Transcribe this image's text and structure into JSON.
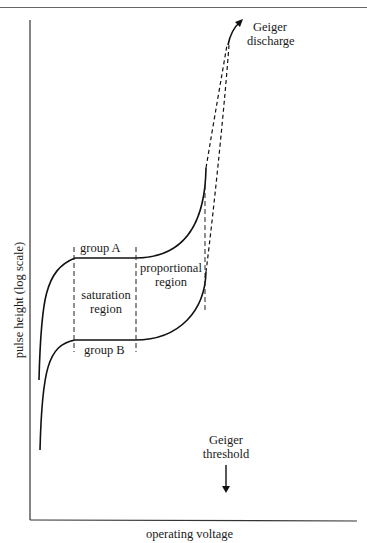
{
  "diagram": {
    "axes": {
      "xlabel": "operating voltage",
      "ylabel": "pulse height (log scale)"
    },
    "labels": {
      "group_a": "group A",
      "group_b": "group B",
      "saturation_line1": "saturation",
      "saturation_line2": "region",
      "proportional_line1": "proportional",
      "proportional_line2": "region",
      "geiger_discharge_line1": "Geiger",
      "geiger_discharge_line2": "discharge",
      "geiger_threshold_line1": "Geiger",
      "geiger_threshold_line2": "threshold"
    },
    "curves": [
      {
        "name": "group A",
        "shape": "rise, plateau (saturation), rise (proportional), dashed to Geiger discharge"
      },
      {
        "name": "group B",
        "shape": "rise, lower plateau (saturation), rise (proportional), dashed merging into Geiger discharge"
      }
    ],
    "regions": [
      "saturation region",
      "proportional region",
      "Geiger discharge"
    ]
  }
}
